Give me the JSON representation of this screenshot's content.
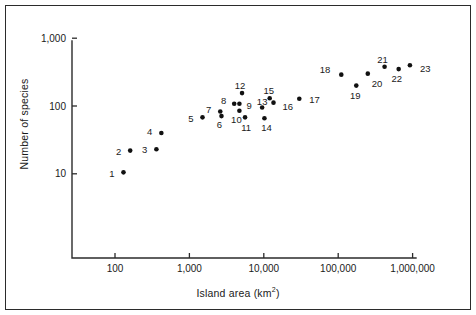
{
  "chart_data": {
    "type": "scatter",
    "title": "",
    "xlabel": "Island area (km2)",
    "xlabel_base": "Island area (km",
    "xlabel_sup": "2",
    "xlabel_tail": ")",
    "ylabel": "Number of species",
    "xscale": "log",
    "yscale": "log",
    "xlim": [
      30,
      3000000
    ],
    "ylim": [
      3.2,
      1400
    ],
    "grid": false,
    "legend": "none",
    "xticks": [
      100,
      1000,
      10000,
      100000,
      1000000
    ],
    "xtick_labels": [
      "100",
      "1,000",
      "10,000",
      "100,000",
      "1,000,000"
    ],
    "yticks": [
      10,
      100,
      1000
    ],
    "ytick_labels": [
      "10",
      "100",
      "1,000"
    ],
    "point_label_position": "varies",
    "points": [
      {
        "label": "1",
        "x": 130,
        "y": 10.5,
        "lx": -9,
        "ly": 1
      },
      {
        "label": "2",
        "x": 160,
        "y": 22,
        "lx": -9,
        "ly": 1
      },
      {
        "label": "3",
        "x": 360,
        "y": 23,
        "lx": -9,
        "ly": 1
      },
      {
        "label": "4",
        "x": 420,
        "y": 40,
        "lx": -9,
        "ly": -1
      },
      {
        "label": "5",
        "x": 1500,
        "y": 68,
        "lx": -9,
        "ly": 1
      },
      {
        "label": "6",
        "x": 2700,
        "y": 71,
        "lx": -2,
        "ly": 9
      },
      {
        "label": "7",
        "x": 2600,
        "y": 83,
        "lx": -9,
        "ly": -2
      },
      {
        "label": "8",
        "x": 4000,
        "y": 108,
        "lx": -8,
        "ly": -3
      },
      {
        "label": "9",
        "x": 4700,
        "y": 108,
        "lx": 7,
        "ly": 2
      },
      {
        "label": "10",
        "x": 4700,
        "y": 85,
        "lx": -3,
        "ly": 9
      },
      {
        "label": "11",
        "x": 5600,
        "y": 68,
        "lx": 1,
        "ly": 10
      },
      {
        "label": "12",
        "x": 5100,
        "y": 155,
        "lx": -2,
        "ly": -7
      },
      {
        "label": "13",
        "x": 9500,
        "y": 95,
        "lx": 0,
        "ly": -6
      },
      {
        "label": "14",
        "x": 10200,
        "y": 66,
        "lx": 2,
        "ly": 10
      },
      {
        "label": "15",
        "x": 12000,
        "y": 130,
        "lx": -1,
        "ly": -7
      },
      {
        "label": "16",
        "x": 13500,
        "y": 112,
        "lx": 9,
        "ly": 4
      },
      {
        "label": "17",
        "x": 30000,
        "y": 128,
        "lx": 10,
        "ly": 1
      },
      {
        "label": "18",
        "x": 110000,
        "y": 290,
        "lx": -11,
        "ly": -5
      },
      {
        "label": "19",
        "x": 175000,
        "y": 200,
        "lx": -1,
        "ly": 10
      },
      {
        "label": "20",
        "x": 250000,
        "y": 300,
        "lx": 4,
        "ly": 10
      },
      {
        "label": "21",
        "x": 420000,
        "y": 380,
        "lx": -2,
        "ly": -7
      },
      {
        "label": "22",
        "x": 650000,
        "y": 350,
        "lx": -2,
        "ly": 10
      },
      {
        "label": "23",
        "x": 920000,
        "y": 400,
        "lx": 10,
        "ly": 4
      }
    ]
  },
  "colors": {
    "marker": "#111111",
    "axis": "#2b2b2b",
    "frame": "#2b2b2b",
    "text": "#1a1a1a",
    "background": "#ffffff"
  }
}
